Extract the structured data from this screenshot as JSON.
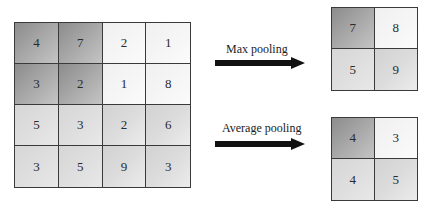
{
  "input_matrix": {
    "rows": [
      [
        {
          "value": "4",
          "shade": "dark"
        },
        {
          "value": "7",
          "shade": "dark"
        },
        {
          "value": "2",
          "shade": "white"
        },
        {
          "value": "1",
          "shade": "white"
        }
      ],
      [
        {
          "value": "3",
          "shade": "dark"
        },
        {
          "value": "2",
          "shade": "dark"
        },
        {
          "value": "1",
          "shade": "white"
        },
        {
          "value": "8",
          "shade": "white"
        }
      ],
      [
        {
          "value": "5",
          "shade": "light"
        },
        {
          "value": "3",
          "shade": "light"
        },
        {
          "value": "2",
          "shade": "mid"
        },
        {
          "value": "6",
          "shade": "mid"
        }
      ],
      [
        {
          "value": "3",
          "shade": "light"
        },
        {
          "value": "5",
          "shade": "light"
        },
        {
          "value": "9",
          "shade": "mid"
        },
        {
          "value": "3",
          "shade": "mid"
        }
      ]
    ]
  },
  "max_pooling": {
    "label": "Max pooling",
    "result": [
      [
        {
          "value": "7",
          "shade": "dark"
        },
        {
          "value": "8",
          "shade": "white"
        }
      ],
      [
        {
          "value": "5",
          "shade": "light"
        },
        {
          "value": "9",
          "shade": "mid"
        }
      ]
    ]
  },
  "average_pooling": {
    "label": "Average pooling",
    "result": [
      [
        {
          "value": "4",
          "shade": "dark"
        },
        {
          "value": "3",
          "shade": "white"
        }
      ],
      [
        {
          "value": "4",
          "shade": "light"
        },
        {
          "value": "5",
          "shade": "mid"
        }
      ]
    ]
  },
  "colors": {
    "grid_line": "#3a3a3a",
    "arrow": "#111111",
    "shade_dark": "#8c8c8c",
    "shade_white": "#f4f4f4",
    "shade_light": "#d8d8d8",
    "shade_mid": "#e0e0e0"
  }
}
